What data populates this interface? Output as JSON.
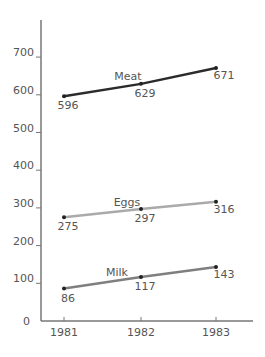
{
  "chart_data": {
    "type": "line",
    "title": "",
    "xlabel": "",
    "ylabel": "",
    "categories": [
      "1981",
      "1982",
      "1983"
    ],
    "ylim": [
      0,
      800
    ],
    "yticks": [
      "0",
      "100",
      "200",
      "300",
      "400",
      "500",
      "600",
      "700"
    ],
    "grid": false,
    "legend": "inline labels",
    "series": [
      {
        "name": "Meat",
        "values": [
          596,
          629,
          671
        ],
        "labels": [
          "596",
          "629",
          "671"
        ],
        "color": "#2b2b2b"
      },
      {
        "name": "Eggs",
        "values": [
          275,
          297,
          316
        ],
        "labels": [
          "275",
          "297",
          "316"
        ],
        "color": "#aaaaaa"
      },
      {
        "name": "Milk",
        "values": [
          86,
          117,
          143
        ],
        "labels": [
          "86",
          "117",
          "143"
        ],
        "color": "#7f7f7f"
      }
    ]
  }
}
